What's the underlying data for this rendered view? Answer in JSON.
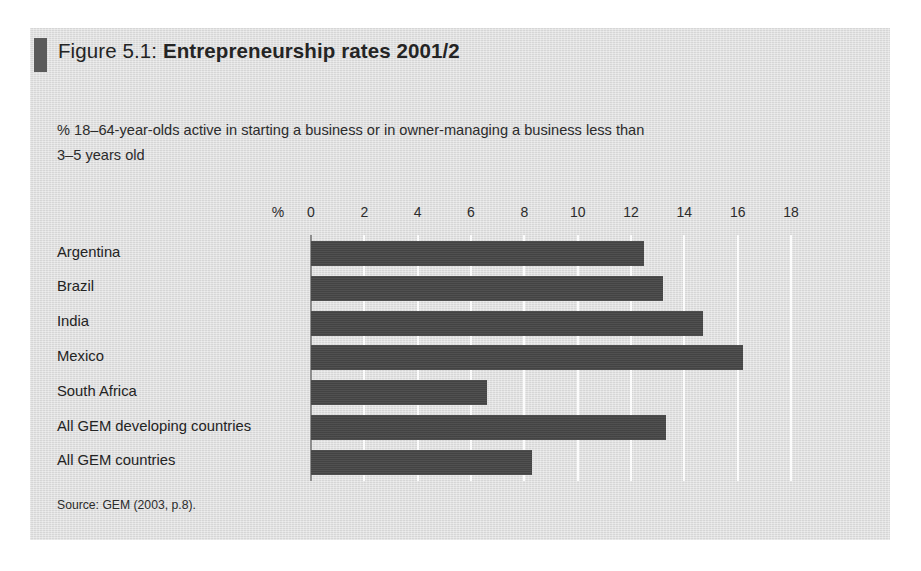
{
  "figure": {
    "title_prefix": "Figure 5.1: ",
    "title_main": "Entrepreneurship rates 2001/2",
    "subtitle_line1": "% 18–64-year-olds active in starting a business or in owner-managing a business less than",
    "subtitle_line2": "3–5 years old",
    "source": "Source: GEM (2003, p.8).",
    "marker_color": "#5b5b5b",
    "panel_color": "#dbdbdb",
    "bar_color": "#474747",
    "gridline_color": "#fbfbfb",
    "axis_color": "#8e8e8e"
  },
  "chart_data": {
    "type": "bar",
    "orientation": "horizontal",
    "title": "Figure 5.1: Entrepreneurship rates 2001/2",
    "subtitle": "% 18–64-year-olds active in starting a business or in owner-managing a business less than 3–5 years old",
    "xlabel": "%",
    "ylabel": "",
    "xlim": [
      0,
      18
    ],
    "xticks": [
      0,
      2,
      4,
      6,
      8,
      10,
      12,
      14,
      16,
      18
    ],
    "grid": true,
    "legend": null,
    "categories": [
      "Argentina",
      "Brazil",
      "India",
      "Mexico",
      "South Africa",
      "All GEM developing countries",
      "All GEM countries"
    ],
    "values": [
      12.5,
      13.2,
      14.7,
      16.2,
      6.6,
      13.3,
      8.3
    ],
    "source": "GEM (2003, p.8)"
  }
}
